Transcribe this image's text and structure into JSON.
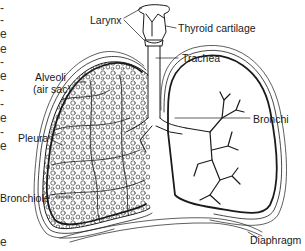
{
  "diagram": {
    "labels": {
      "larynx": "Larynx",
      "thyroid_cartilage": "Thyroid cartilage",
      "trachea": "Trachea",
      "alveoli_line1": "Alveoli",
      "alveoli_line2": "(air sac)",
      "bronchi": "Bronchi",
      "pleura": "Pleura",
      "bronchiole": "Bronchiole",
      "diaphragm": "Diaphragm"
    },
    "edge_text": [
      "-",
      "-",
      "e",
      "e",
      "-",
      "e",
      "-",
      "-",
      "e",
      "-",
      "e",
      "e"
    ],
    "colors": {
      "line": "#1a1a1a",
      "background": "#ffffff"
    }
  }
}
